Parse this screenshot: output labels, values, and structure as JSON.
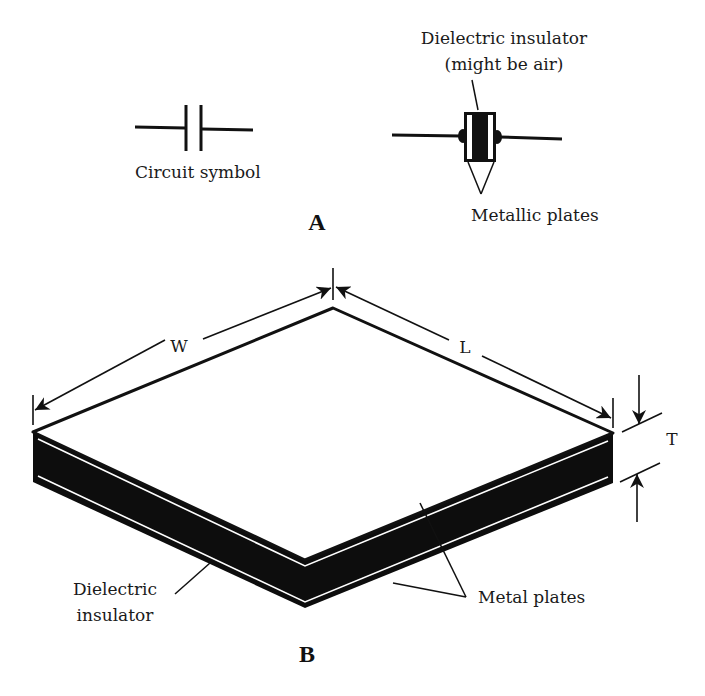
{
  "figure": {
    "panel_a": {
      "label": "A",
      "circuit_symbol_caption": "Circuit symbol",
      "component": {
        "insulator_caption_line1": "Dielectric insulator",
        "insulator_caption_line2": "(might be air)",
        "plates_caption": "Metallic plates"
      }
    },
    "panel_b": {
      "label": "B",
      "dimensions": {
        "width_label": "W",
        "length_label": "L",
        "thickness_label": "T"
      },
      "insulator_caption_line1": "Dielectric",
      "insulator_caption_line2": "insulator",
      "plates_caption": "Metal plates"
    },
    "colors": {
      "ink": "#111111",
      "background": "#ffffff"
    }
  }
}
